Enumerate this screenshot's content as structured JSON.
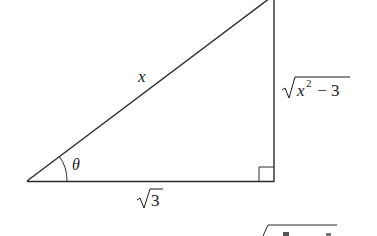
{
  "diagram": {
    "type": "right-triangle",
    "labels": {
      "hypotenuse": "x",
      "angle": "θ",
      "adjacent_radicand": "3",
      "opposite_var": "x",
      "opposite_exp": "2",
      "opposite_rest": " − 3"
    },
    "right_angle_marker": true,
    "colors": {
      "stroke": "#2a2a2a",
      "background": "#ffffff"
    },
    "partial_bottom_formula": "√(x² − 3) (cut off)"
  }
}
